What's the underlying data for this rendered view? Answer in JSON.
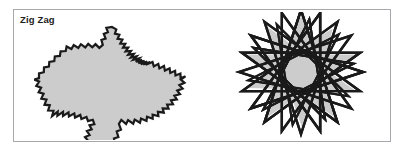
{
  "figure": {
    "label": "Zig Zag",
    "panel": {
      "border_color": "#a8a8ac",
      "background_color": "#ffffff",
      "x": 13,
      "y": 9,
      "width": 378,
      "height": 133
    },
    "colors": {
      "fill_gray": "#cccccc",
      "outline_black": "#1a1a1a",
      "label_text": "#1c1c1c",
      "page_background": "#ffffff"
    },
    "shapes": [
      {
        "id": "left-figure",
        "name": "zigzag-star-outline",
        "description": "Five-pointed star with sawtooth zigzag edges, light gray fill and black outline",
        "points": 5,
        "teeth_per_edge": 5,
        "fill": "#cccccc",
        "stroke": "#1a1a1a",
        "stroke_width": 2.2
      },
      {
        "id": "right-figure",
        "name": "overlapping-star-polygon",
        "description": "Dense overlapping star polygon / spirograph pattern built from repeated rotated star paths with gray fill and heavy black strokes",
        "points": 5,
        "overlay_rotations": 10,
        "fill": "#cccccc",
        "stroke": "#1a1a1a",
        "stroke_width": 2.4
      }
    ]
  }
}
